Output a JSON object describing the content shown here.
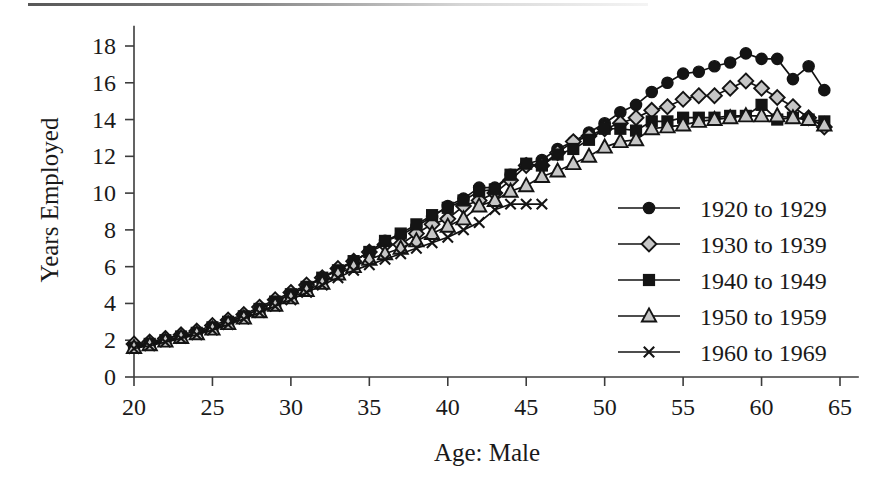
{
  "figure": {
    "name": "years-employed-by-age-male-line-chart",
    "background_color": "#ffffff",
    "ink_color": "#1a1a1a"
  },
  "chart_data": {
    "type": "line",
    "title": "",
    "subtitle": "",
    "xlabel": "Age: Male",
    "ylabel": "Years Employed",
    "xlim": [
      19,
      66
    ],
    "ylim": [
      0,
      19
    ],
    "xticks": [
      20,
      25,
      30,
      35,
      40,
      45,
      50,
      55,
      60,
      65
    ],
    "yticks": [
      0,
      2,
      4,
      6,
      8,
      10,
      12,
      14,
      16,
      18
    ],
    "grid": false,
    "legend_position": "right-middle",
    "series": [
      {
        "name": "1920 to 1929",
        "marker": "filled-circle",
        "marker_fill": "#141414",
        "line_color": "#121212",
        "x": [
          20,
          21,
          22,
          23,
          24,
          25,
          26,
          27,
          28,
          29,
          30,
          31,
          32,
          33,
          34,
          35,
          36,
          37,
          38,
          39,
          40,
          41,
          42,
          43,
          44,
          45,
          46,
          47,
          48,
          49,
          50,
          51,
          52,
          53,
          54,
          55,
          56,
          57,
          58,
          59,
          60,
          61,
          62,
          63,
          64
        ],
        "y": [
          1.7,
          1.85,
          2.0,
          2.2,
          2.4,
          2.7,
          3.0,
          3.3,
          3.7,
          4.1,
          4.5,
          4.9,
          5.4,
          5.8,
          6.3,
          6.8,
          7.4,
          7.7,
          8.2,
          8.7,
          9.3,
          9.7,
          10.3,
          10.3,
          11.0,
          11.6,
          11.8,
          12.4,
          12.8,
          13.3,
          13.8,
          14.4,
          14.8,
          15.5,
          16.0,
          16.5,
          16.6,
          16.9,
          17.1,
          17.6,
          17.3,
          17.3,
          16.2,
          16.9,
          15.6
        ]
      },
      {
        "name": "1930 to 1939",
        "marker": "gray-diamond",
        "marker_fill": "#c6c6c6",
        "line_color": "#121212",
        "x": [
          20,
          21,
          22,
          23,
          24,
          25,
          26,
          27,
          28,
          29,
          30,
          31,
          32,
          33,
          34,
          35,
          36,
          37,
          38,
          39,
          40,
          41,
          42,
          43,
          44,
          45,
          46,
          47,
          48,
          49,
          50,
          51,
          52,
          53,
          54,
          55,
          56,
          57,
          58,
          59,
          60,
          61,
          62,
          63,
          64
        ],
        "y": [
          1.8,
          1.9,
          2.1,
          2.3,
          2.5,
          2.8,
          3.1,
          3.4,
          3.8,
          4.2,
          4.6,
          5.0,
          5.4,
          5.9,
          6.3,
          6.8,
          7.2,
          7.2,
          7.8,
          8.3,
          8.6,
          9.3,
          9.6,
          10.0,
          10.7,
          11.5,
          11.5,
          12.2,
          12.8,
          13.1,
          13.5,
          13.8,
          14.1,
          14.5,
          14.7,
          15.1,
          15.3,
          15.3,
          15.7,
          16.1,
          15.7,
          15.2,
          14.7,
          14.1,
          13.6
        ]
      },
      {
        "name": "1940 to 1949",
        "marker": "filled-square",
        "marker_fill": "#141414",
        "line_color": "#121212",
        "x": [
          20,
          21,
          22,
          23,
          24,
          25,
          26,
          27,
          28,
          29,
          30,
          31,
          32,
          33,
          34,
          35,
          36,
          37,
          38,
          39,
          40,
          41,
          42,
          43,
          44,
          45,
          46,
          47,
          48,
          49,
          50,
          51,
          52,
          53,
          54,
          55,
          56,
          57,
          58,
          59,
          60,
          61,
          62,
          63,
          64
        ],
        "y": [
          1.6,
          1.8,
          2.0,
          2.2,
          2.4,
          2.7,
          3.0,
          3.3,
          3.7,
          4.1,
          4.5,
          4.9,
          5.4,
          5.8,
          6.3,
          6.8,
          7.4,
          7.8,
          8.3,
          8.8,
          9.2,
          9.6,
          10.1,
          10.2,
          11.0,
          11.6,
          11.5,
          12.1,
          12.4,
          12.9,
          13.5,
          13.5,
          13.4,
          13.9,
          13.9,
          14.1,
          14.1,
          14.1,
          14.2,
          14.2,
          14.8,
          14.0,
          14.1,
          14.0,
          13.9
        ]
      },
      {
        "name": "1950 to 1959",
        "marker": "gray-triangle",
        "marker_fill": "#c6c6c6",
        "line_color": "#121212",
        "x": [
          20,
          21,
          22,
          23,
          24,
          25,
          26,
          27,
          28,
          29,
          30,
          31,
          32,
          33,
          34,
          35,
          36,
          37,
          38,
          39,
          40,
          41,
          42,
          43,
          44,
          45,
          46,
          47,
          48,
          49,
          50,
          51,
          52,
          53,
          54,
          55,
          56,
          57,
          58,
          59,
          60,
          61,
          62,
          63,
          64
        ],
        "y": [
          1.6,
          1.75,
          1.95,
          2.15,
          2.35,
          2.6,
          2.9,
          3.2,
          3.55,
          3.9,
          4.3,
          4.7,
          5.1,
          5.6,
          6.0,
          6.4,
          6.7,
          7.0,
          7.4,
          7.8,
          8.2,
          8.6,
          9.3,
          9.6,
          10.1,
          10.4,
          10.9,
          11.2,
          11.6,
          12.0,
          12.5,
          12.8,
          12.9,
          13.5,
          13.6,
          13.7,
          13.9,
          14.0,
          14.1,
          14.2,
          14.2,
          14.2,
          14.1,
          14.0,
          13.7
        ]
      },
      {
        "name": "1960 to 1969",
        "marker": "cross",
        "marker_fill": "none",
        "line_color": "#121212",
        "x": [
          20,
          21,
          22,
          23,
          24,
          25,
          26,
          27,
          28,
          29,
          30,
          31,
          32,
          33,
          34,
          35,
          36,
          37,
          38,
          39,
          40,
          41,
          42,
          43,
          44,
          45,
          46
        ],
        "y": [
          1.55,
          1.7,
          1.9,
          2.1,
          2.3,
          2.55,
          2.85,
          3.15,
          3.5,
          3.85,
          4.2,
          4.6,
          5.0,
          5.4,
          5.8,
          6.1,
          6.4,
          6.7,
          7.0,
          7.3,
          7.6,
          8.0,
          8.4,
          9.1,
          9.4,
          9.4,
          9.4
        ]
      }
    ]
  }
}
